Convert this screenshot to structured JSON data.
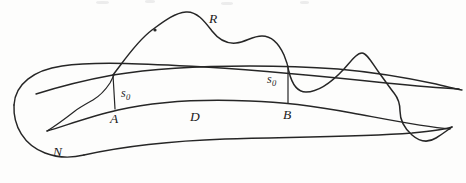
{
  "figure": {
    "kind": "hand-drawn mathematical diagram",
    "background_color": "#fdfdfc",
    "ink_color": "#262626",
    "labels": [
      {
        "id": "R",
        "text": "R",
        "x": 209,
        "y": 12,
        "role": "curve-label"
      },
      {
        "id": "s0_left",
        "text": "s",
        "sub": "0",
        "x": 121,
        "y": 87,
        "role": "distance-label"
      },
      {
        "id": "s0_right",
        "text": "s",
        "sub": "0",
        "x": 267,
        "y": 73,
        "role": "distance-label"
      },
      {
        "id": "A",
        "text": "A",
        "x": 110,
        "y": 112,
        "role": "point-label"
      },
      {
        "id": "D",
        "text": "D",
        "x": 190,
        "y": 110,
        "role": "region-label"
      },
      {
        "id": "B",
        "text": "B",
        "x": 283,
        "y": 108,
        "role": "point-label"
      },
      {
        "id": "N",
        "text": "N",
        "x": 53,
        "y": 145,
        "role": "region-label"
      }
    ],
    "annotations": {
      "tick_dot": {
        "x": 155,
        "y": 30,
        "r": 1.6,
        "on": "curve-R"
      },
      "segment_A": {
        "x": 113,
        "y1": 75,
        "y2": 109,
        "label": "s0"
      },
      "segment_B": {
        "x": 288,
        "y1": 66,
        "y2": 103,
        "label": "s0"
      },
      "vertex_N": {
        "x": 47,
        "y": 131
      }
    }
  }
}
